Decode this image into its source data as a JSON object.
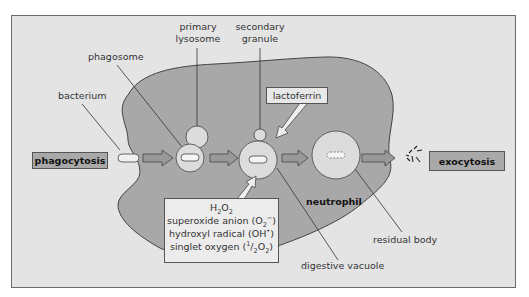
{
  "diagram": {
    "process_labels": {
      "start": "phagocytosis",
      "end": "exocytosis"
    },
    "cell_label": "neutrophil",
    "structures": {
      "bacterium": "bacterium",
      "phagosome": "phagosome",
      "primary_lysosome_line1": "primary",
      "primary_lysosome_line2": "lysosome",
      "secondary_granule_line1": "secondary",
      "secondary_granule_line2": "granule",
      "lactoferrin": "lactoferrin",
      "digestive_vacuole": "digestive vacuole",
      "residual_body": "residual body"
    },
    "reactive_oxygen_species": {
      "line1_html": "H<sub>2</sub>O<sub>2</sub>",
      "line2_html": "superoxide anion (O<sub>2</sub><sup>&minus;</sup>)",
      "line3_html": "hydroxyl radical (OH<sup>&bull;</sup>)",
      "line4_html": "singlet oxygen (<sup>1</sup>/<sub>2</sub>O<sub>2</sub>)",
      "items": [
        "H2O2",
        "superoxide anion (O2−)",
        "hydroxyl radical (OH•)",
        "singlet oxygen (1/2O2)"
      ]
    },
    "colors": {
      "background": "#e4e4e4",
      "cell": "#a8a8a8",
      "vesicle": "#dcdcdc",
      "process_box": "#a9a9a9",
      "outline": "#555555"
    }
  }
}
